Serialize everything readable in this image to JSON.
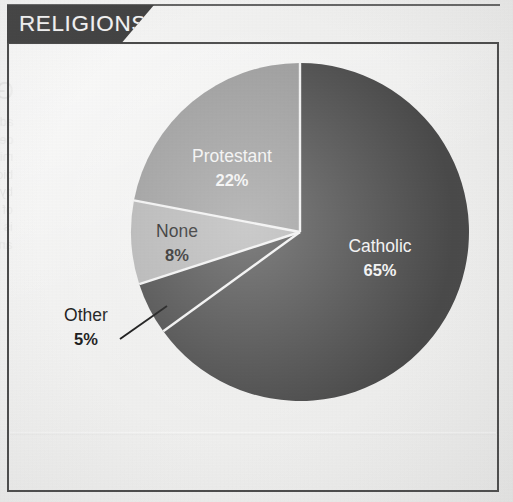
{
  "header": {
    "title": "RELIGIONS"
  },
  "ghost_text": {
    "title": "Government and Politics",
    "lines": [
      "administration is divided into",
      "departments each headed by a",
      "minister. The legislature is",
      "bicameral. Members are elected",
      "by popular vote to serve terms",
      "of four years. The judiciary",
      "is independent of the executive",
      "and the legislature."
    ]
  },
  "chart_data": {
    "type": "pie",
    "title": "RELIGIONS",
    "unit": "%",
    "start_angle_deg": 0,
    "direction": "clockwise",
    "legend": "none-labels-inline",
    "categories": [
      "Catholic",
      "Other",
      "None",
      "Protestant"
    ],
    "values": [
      65,
      5,
      8,
      22
    ],
    "slices": [
      {
        "name": "Catholic",
        "value": 65,
        "pct_label": "65%",
        "color": "#4a4a4a",
        "label_color": "#f2f2f2",
        "label_placement": "inside",
        "label_x": 380,
        "label_y": 252
      },
      {
        "name": "Other",
        "value": 5,
        "pct_label": "5%",
        "color": "#4a4a4a",
        "label_color": "#1d1d1d",
        "label_placement": "outside-with-leader",
        "label_x": 86,
        "label_y": 321,
        "leader_from_x": 120,
        "leader_from_y": 339,
        "leader_to_x": 167,
        "leader_to_y": 306
      },
      {
        "name": "None",
        "value": 8,
        "pct_label": "8%",
        "color": "#b4b4b4",
        "label_color": "#1d1d1d",
        "label_placement": "inside",
        "label_x": 177,
        "label_y": 237
      },
      {
        "name": "Protestant",
        "value": 22,
        "pct_label": "22%",
        "color": "#9b9b9b",
        "label_color": "#f2f2f2",
        "label_placement": "inside",
        "label_x": 232,
        "label_y": 162
      }
    ],
    "geometry": {
      "center_x": 300,
      "center_y": 232,
      "radius": 169,
      "separator_color": "#f1f1f1",
      "separator_width": 2.4
    }
  },
  "colors": {
    "banner_bg": "#434343",
    "banner_text": "#f4f4f4",
    "card_border": "#4b4b4b",
    "paper": "#ededec",
    "dark_slice": "#4a4a4a",
    "mid_slice": "#9b9b9b",
    "light_slice": "#b4b4b4"
  }
}
